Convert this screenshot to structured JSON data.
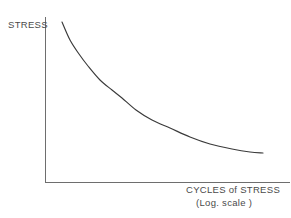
{
  "figure": {
    "background_color": "#ffffff",
    "line_color": "#3a3a3a",
    "axis_color": "#6e6e6e"
  },
  "labels": {
    "y_axis": "STRESS",
    "x_axis_main": "CYCLES of STRESS",
    "x_axis_sub": "(Log. scale )"
  },
  "chart_data": {
    "type": "line",
    "title": "",
    "xlabel": "CYCLES of STRESS (Log. scale )",
    "ylabel": "STRESS",
    "grid": false,
    "legend": "none",
    "axis_origin_px": [
      45,
      183
    ],
    "x_axis_end_px": [
      290,
      183
    ],
    "y_axis_top_px": [
      45,
      17
    ],
    "xlim": [
      0,
      1
    ],
    "ylim": [
      0,
      1
    ],
    "series": [
      {
        "name": "S-N fatigue curve",
        "points_px": [
          [
            62,
            22
          ],
          [
            70,
            40
          ],
          [
            79,
            54
          ],
          [
            88,
            66
          ],
          [
            100,
            80
          ],
          [
            112,
            90
          ],
          [
            122,
            98
          ],
          [
            136,
            110
          ],
          [
            152,
            120
          ],
          [
            170,
            128
          ],
          [
            190,
            137
          ],
          [
            210,
            144
          ],
          [
            232,
            149
          ],
          [
            250,
            152
          ],
          [
            263,
            153
          ]
        ],
        "x_norm": [
          0.069,
          0.102,
          0.139,
          0.175,
          0.224,
          0.273,
          0.314,
          0.371,
          0.437,
          0.51,
          0.592,
          0.673,
          0.763,
          0.837,
          0.89
        ],
        "y_norm": [
          0.97,
          0.861,
          0.777,
          0.705,
          0.62,
          0.56,
          0.512,
          0.44,
          0.38,
          0.331,
          0.277,
          0.235,
          0.205,
          0.187,
          0.181
        ],
        "description": "monotonically decreasing curve flattening toward an endurance limit"
      }
    ]
  }
}
